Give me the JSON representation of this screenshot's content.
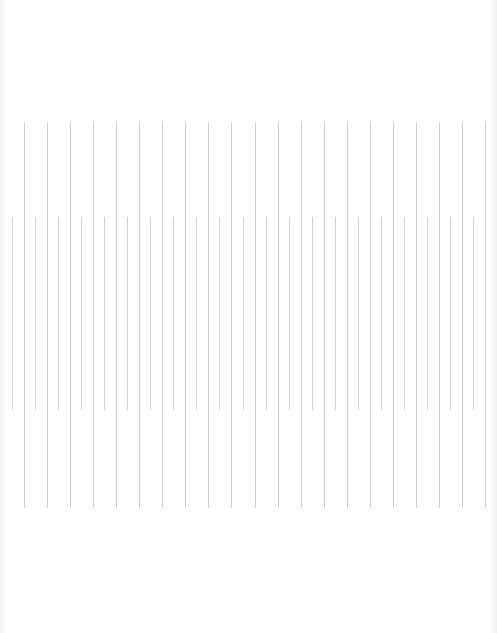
{
  "page": {
    "background": "#ffffff",
    "line_color": "#cfcfcf"
  },
  "rows": [
    {
      "name": "row-1",
      "top": 122,
      "bottom": 508,
      "x_start": 24,
      "spacing": 23.05,
      "count": 21
    },
    {
      "name": "row-2",
      "top": 217,
      "bottom": 410,
      "x_start": 12,
      "spacing": 23.05,
      "count": 21
    }
  ]
}
